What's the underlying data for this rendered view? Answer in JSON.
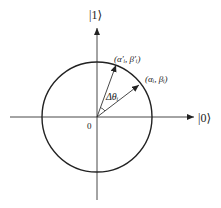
{
  "diagram": {
    "type": "qubit-state-rotation",
    "axes": {
      "horizontal_label": "|0⟩",
      "vertical_label": "|1⟩",
      "origin_label": "0"
    },
    "circle": {
      "description": "unit circle"
    },
    "vectors": [
      {
        "label": "(α′ᵢ, β′ᵢ)",
        "angle_deg": 70
      },
      {
        "label": "(αᵢ, βᵢ)",
        "angle_deg": 36
      }
    ],
    "angle_label": "Δθᵢ",
    "colors": {
      "stroke": "#222222",
      "background": "#ffffff"
    }
  }
}
